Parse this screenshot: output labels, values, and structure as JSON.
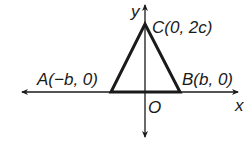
{
  "diagram": {
    "type": "coordinate-geometry",
    "axes": {
      "x_label": "x",
      "y_label": "y",
      "origin_label": "O"
    },
    "vertices": [
      {
        "name": "A",
        "label": "A(−b, 0)",
        "coords": [
          "−b",
          "0"
        ]
      },
      {
        "name": "B",
        "label": "B(b, 0)",
        "coords": [
          "b",
          "0"
        ]
      },
      {
        "name": "C",
        "label": "C(0, 2c)",
        "coords": [
          "0",
          "2c"
        ]
      }
    ],
    "colors": {
      "stroke": "#1a1a1a",
      "background": "#ffffff"
    }
  }
}
